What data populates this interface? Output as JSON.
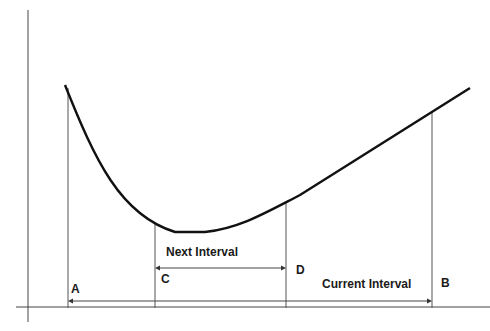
{
  "diagram": {
    "points": [
      {
        "id": "A",
        "label": "A"
      },
      {
        "id": "C",
        "label": "C"
      },
      {
        "id": "D",
        "label": "D"
      },
      {
        "id": "B",
        "label": "B"
      }
    ],
    "intervals": {
      "next": {
        "label": "Next Interval",
        "from": "C",
        "to": "D"
      },
      "current": {
        "label": "Current Interval",
        "from": "A",
        "to": "B"
      }
    },
    "colors": {
      "curve": "#111111",
      "lines": "#555555",
      "text": "#1a1a1a",
      "background": "#ffffff"
    }
  }
}
